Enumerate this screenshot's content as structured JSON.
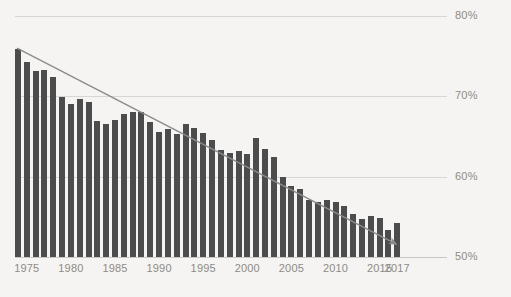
{
  "chart_data": {
    "type": "bar",
    "title": "",
    "subtitle": "",
    "xlabel": "",
    "ylabel": "",
    "ylim": [
      50,
      80
    ],
    "xlim": [
      1974,
      2017
    ],
    "grid": true,
    "legend": null,
    "y_ticks": [
      "80%",
      "70%",
      "60%",
      "50%"
    ],
    "y_tick_values": [
      80,
      70,
      60,
      50
    ],
    "x_ticks": [
      "1975",
      "1980",
      "1985",
      "1990",
      "1995",
      "2000",
      "2005",
      "2010",
      "2015",
      "2017"
    ],
    "x_tick_values": [
      1975,
      1980,
      1985,
      1990,
      1995,
      2000,
      2005,
      2010,
      2015,
      2017
    ],
    "bar_color": "#4c4c4c",
    "grid_color": "#d8d6d2",
    "background_color": "#f5f4f2",
    "text_color": "#8d8b88",
    "categories": [
      1974,
      1975,
      1976,
      1977,
      1978,
      1979,
      1980,
      1981,
      1982,
      1983,
      1984,
      1985,
      1986,
      1987,
      1988,
      1989,
      1990,
      1991,
      1992,
      1993,
      1994,
      1995,
      1996,
      1997,
      1998,
      1999,
      2000,
      2001,
      2002,
      2003,
      2004,
      2005,
      2006,
      2007,
      2008,
      2009,
      2010,
      2011,
      2012,
      2013,
      2014,
      2015,
      2016,
      2017
    ],
    "values": [
      75.9,
      74.3,
      73.2,
      73.3,
      72.4,
      69.9,
      69.0,
      69.7,
      69.3,
      66.9,
      66.6,
      67.0,
      67.8,
      68.1,
      68.1,
      66.8,
      65.5,
      65.9,
      65.3,
      66.5,
      66.0,
      65.4,
      64.6,
      63.3,
      62.9,
      63.2,
      62.8,
      64.8,
      63.5,
      62.4,
      60.0,
      58.9,
      58.5,
      57.1,
      56.9,
      57.1,
      56.8,
      56.4,
      55.4,
      54.7,
      55.1,
      54.9,
      53.4,
      54.2
    ],
    "annotations": [
      {
        "type": "arrow",
        "name": "declining-trend-arrow",
        "from": {
          "x": 1974,
          "y": 76.0
        },
        "to": {
          "x": 2017,
          "y": 51.6
        },
        "color": "#8b8b8b"
      }
    ]
  }
}
